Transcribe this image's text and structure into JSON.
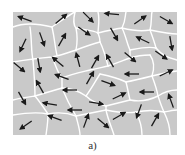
{
  "figure": {
    "caption": "a)",
    "panel": {
      "x": 13,
      "y": 12,
      "width": 164,
      "height": 123
    },
    "colors": {
      "grain_fill": "#c9c9c9",
      "boundary": "#ffffff",
      "arrow": "#1a1a1a",
      "background": "#ffffff"
    },
    "boundaries": [
      "M13,27 C25,22 40,24 52,27 C60,22 70,14 75,12",
      "M52,27 C55,40 55,48 57,55",
      "M75,12 C73,20 74,26 76,28 C84,30 92,30 98,33",
      "M98,12 C100,20 98,28 98,33",
      "M98,33 C106,31 115,29 122,28 C126,20 125,15 126,12",
      "M122,28 C130,30 140,32 150,30 C152,22 151,15 152,12",
      "M150,30 C160,32 170,34 177,34",
      "M13,62 C25,60 40,58 52,57 C62,55 70,52 76,50",
      "M30,27 C32,40 31,52 33,60",
      "M76,28 C78,38 77,45 76,50",
      "M76,50 C84,47 92,44 100,42",
      "M98,33 C100,38 100,40 100,42",
      "M100,42 C104,50 106,58 108,66",
      "M122,28 C126,36 127,44 130,50",
      "M130,50 C140,48 148,46 156,48",
      "M150,30 C153,38 155,44 156,48",
      "M156,48 C162,56 170,58 177,60",
      "M13,100 C20,98 28,97 35,96",
      "M33,60 C34,72 35,85 35,96",
      "M35,96 C45,93 55,90 62,88",
      "M52,57 C56,66 58,74 62,78",
      "M62,78 C72,74 82,72 90,70 C98,68 104,67 108,66",
      "M62,78 C62,82 62,85 62,88",
      "M108,66 C118,63 124,60 130,58 C136,56 142,55 150,55",
      "M130,50 C130,54 130,56 130,58",
      "M150,55 C155,62 154,70 152,76",
      "M152,76 C160,74 168,72 177,71",
      "M62,88 C72,88 80,92 86,96",
      "M86,96 C92,88 96,80 100,74",
      "M100,74 C110,76 118,78 126,82",
      "M126,82 C136,80 144,78 152,76",
      "M126,82 C128,90 129,96 130,100",
      "M86,96 C92,102 98,104 106,106",
      "M106,106 C114,104 122,102 130,100",
      "M130,100 C140,102 150,100 158,96",
      "M158,96 C164,92 170,90 177,90",
      "M152,76 C155,84 157,90 158,96",
      "M13,115 C25,113 38,112 48,114",
      "M35,96 C40,102 44,108 48,114",
      "M48,114 C58,112 68,113 76,116",
      "M62,88 C66,98 70,106 76,116",
      "M76,116 C78,124 80,130 80,135",
      "M76,116 C86,114 96,112 106,110",
      "M106,106 C106,108 106,109 106,110",
      "M106,110 C108,120 112,128 114,135",
      "M106,110 C116,112 126,114 136,112",
      "M136,112 C140,120 142,128 142,135",
      "M136,112 C146,110 156,110 164,112",
      "M158,96 C160,102 162,108 164,112",
      "M164,112 C168,120 170,128 170,135",
      "M164,112 C170,111 174,110 177,110",
      "M48,114 C48,122 47,128 46,135"
    ],
    "arrows": [
      {
        "x": 25,
        "y": 19,
        "angle": 200
      },
      {
        "x": 61,
        "y": 19,
        "angle": -40
      },
      {
        "x": 88,
        "y": 17,
        "angle": 45
      },
      {
        "x": 112,
        "y": 14,
        "angle": 185
      },
      {
        "x": 140,
        "y": 20,
        "angle": -35
      },
      {
        "x": 166,
        "y": 20,
        "angle": 30
      },
      {
        "x": 23,
        "y": 45,
        "angle": 115
      },
      {
        "x": 42,
        "y": 39,
        "angle": 70
      },
      {
        "x": 62,
        "y": 40,
        "angle": -60
      },
      {
        "x": 84,
        "y": 31,
        "angle": 35
      },
      {
        "x": 114,
        "y": 34,
        "angle": 60
      },
      {
        "x": 143,
        "y": 40,
        "angle": 205
      },
      {
        "x": 171,
        "y": 43,
        "angle": 80
      },
      {
        "x": 19,
        "y": 67,
        "angle": 40
      },
      {
        "x": 39,
        "y": 65,
        "angle": 80
      },
      {
        "x": 58,
        "y": 62,
        "angle": 220
      },
      {
        "x": 78,
        "y": 60,
        "angle": 255
      },
      {
        "x": 95,
        "y": 62,
        "angle": -60
      },
      {
        "x": 110,
        "y": 61,
        "angle": 240
      },
      {
        "x": 130,
        "y": 57,
        "angle": 40
      },
      {
        "x": 161,
        "y": 55,
        "angle": 35
      },
      {
        "x": 62,
        "y": 77,
        "angle": 200
      },
      {
        "x": 90,
        "y": 78,
        "angle": -60
      },
      {
        "x": 132,
        "y": 74,
        "angle": 180
      },
      {
        "x": 166,
        "y": 73,
        "angle": -25
      },
      {
        "x": 22,
        "y": 98,
        "angle": 60
      },
      {
        "x": 40,
        "y": 87,
        "angle": 240
      },
      {
        "x": 70,
        "y": 90,
        "angle": 180
      },
      {
        "x": 108,
        "y": 83,
        "angle": 20
      },
      {
        "x": 119,
        "y": 96,
        "angle": -25
      },
      {
        "x": 147,
        "y": 92,
        "angle": 180
      },
      {
        "x": 171,
        "y": 101,
        "angle": 250
      },
      {
        "x": 50,
        "y": 104,
        "angle": 190
      },
      {
        "x": 75,
        "y": 110,
        "angle": 180
      },
      {
        "x": 96,
        "y": 103,
        "angle": 10
      },
      {
        "x": 26,
        "y": 125,
        "angle": 145
      },
      {
        "x": 55,
        "y": 118,
        "angle": 200
      },
      {
        "x": 86,
        "y": 121,
        "angle": -70
      },
      {
        "x": 103,
        "y": 123,
        "angle": 40
      },
      {
        "x": 119,
        "y": 116,
        "angle": -30
      },
      {
        "x": 139,
        "y": 111,
        "angle": 110
      },
      {
        "x": 155,
        "y": 120,
        "angle": -60
      }
    ]
  }
}
